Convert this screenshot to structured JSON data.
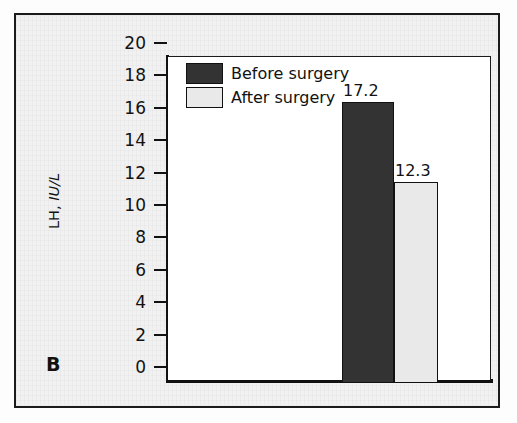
{
  "figure": {
    "panel_label": "B",
    "background_color": "#f1f1f1",
    "frame_color": "#1b1b1b"
  },
  "chart_data": {
    "type": "bar",
    "title": "",
    "subtitle": "",
    "panel": "B",
    "xlabel": "",
    "ylabel": "LH, IU/L",
    "ylabel_prefix": "LH, ",
    "ylabel_unit": "IU/L",
    "ylim": [
      0,
      20
    ],
    "ytick_interval": 2,
    "yticks": [
      0,
      2,
      4,
      6,
      8,
      10,
      12,
      14,
      16,
      18,
      20
    ],
    "ytick_labels": [
      "0",
      "2",
      "4",
      "6",
      "8",
      "10",
      "12",
      "14",
      "16",
      "18",
      "20"
    ],
    "grid": false,
    "legend_position": "top-left-inside",
    "categories": [
      ""
    ],
    "series": [
      {
        "name": "Before surgery",
        "values": [
          17.2
        ],
        "value_labels": [
          "17.2"
        ],
        "color": "#333333",
        "edge_color": "#111111"
      },
      {
        "name": "After surgery",
        "values": [
          12.3
        ],
        "value_labels": [
          "12.3"
        ],
        "color": "#e9e9e9",
        "edge_color": "#111111"
      }
    ],
    "annotations": [
      "17.2",
      "12.3"
    ]
  },
  "legend": {
    "items": [
      {
        "label": "Before surgery",
        "swatch": "dark-swatch"
      },
      {
        "label": "After surgery",
        "swatch": "light-swatch"
      }
    ]
  },
  "bars": [
    {
      "label": "17.2",
      "series": "Before surgery"
    },
    {
      "label": "12.3",
      "series": "After surgery"
    }
  ]
}
